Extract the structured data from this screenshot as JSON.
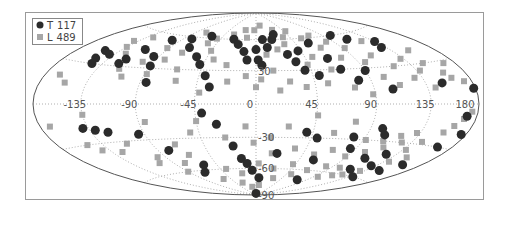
{
  "chart_data": {
    "type": "scatter",
    "projection": "aitoff-hammer (all-sky, galactic coordinates)",
    "title": "",
    "xlabel": "",
    "ylabel": "",
    "longitude_ticks": [
      "-135",
      "-90",
      "-45",
      "0",
      "45",
      "90",
      "135",
      "180"
    ],
    "latitude_ticks": [
      "30",
      "-30",
      "-60",
      "-90"
    ],
    "grid": true,
    "legend_position": "upper-left",
    "legend": [
      {
        "name": "T",
        "count": "117",
        "marker": "circle",
        "color": "#2b2b2b"
      },
      {
        "name": "L",
        "count": "489",
        "marker": "square",
        "color": "#a6a6a6"
      }
    ],
    "series": [
      {
        "name": "T",
        "count": 117,
        "note": "approximate (lon, lat) in degrees, representative subset read from image",
        "points": [
          [
            -150,
            40
          ],
          [
            -148,
            34
          ],
          [
            -145,
            30
          ],
          [
            -140,
            38
          ],
          [
            -120,
            32
          ],
          [
            -118,
            36
          ],
          [
            -112,
            45
          ],
          [
            -100,
            55
          ],
          [
            -95,
            40
          ],
          [
            -90,
            32
          ],
          [
            -85,
            18
          ],
          [
            -80,
            58
          ],
          [
            -70,
            50
          ],
          [
            -60,
            62
          ],
          [
            -55,
            42
          ],
          [
            -48,
            35
          ],
          [
            -40,
            25
          ],
          [
            -35,
            15
          ],
          [
            -28,
            60
          ],
          [
            -20,
            55
          ],
          [
            -12,
            48
          ],
          [
            -8,
            40
          ],
          [
            0,
            50
          ],
          [
            2,
            40
          ],
          [
            5,
            35
          ],
          [
            8,
            60
          ],
          [
            12,
            52
          ],
          [
            20,
            60
          ],
          [
            25,
            65
          ],
          [
            30,
            45
          ],
          [
            35,
            38
          ],
          [
            40,
            30
          ],
          [
            42,
            48
          ],
          [
            50,
            25
          ],
          [
            60,
            55
          ],
          [
            65,
            40
          ],
          [
            70,
            30
          ],
          [
            80,
            20
          ],
          [
            90,
            28
          ],
          [
            100,
            60
          ],
          [
            105,
            12
          ],
          [
            110,
            55
          ],
          [
            130,
            45
          ],
          [
            135,
            50
          ],
          [
            150,
            15
          ],
          [
            170,
            -8
          ],
          [
            178,
            10
          ],
          [
            -140,
            -18
          ],
          [
            -130,
            -20
          ],
          [
            -120,
            -22
          ],
          [
            -95,
            -25
          ],
          [
            -80,
            -40
          ],
          [
            -70,
            -62
          ],
          [
            -60,
            -55
          ],
          [
            -40,
            -8
          ],
          [
            -30,
            -18
          ],
          [
            -20,
            -38
          ],
          [
            -15,
            -50
          ],
          [
            -10,
            -55
          ],
          [
            -5,
            -62
          ],
          [
            0,
            -88
          ],
          [
            5,
            -70
          ],
          [
            20,
            -45
          ],
          [
            40,
            -25
          ],
          [
            50,
            -30
          ],
          [
            60,
            -50
          ],
          [
            75,
            -70
          ],
          [
            80,
            -28
          ],
          [
            85,
            -38
          ],
          [
            100,
            -20
          ],
          [
            105,
            -25
          ],
          [
            110,
            -45
          ],
          [
            115,
            -55
          ],
          [
            125,
            -40
          ],
          [
            130,
            -50
          ],
          [
            140,
            -60
          ],
          [
            150,
            -52
          ],
          [
            165,
            -30
          ],
          [
            160,
            -45
          ],
          [
            175,
            -20
          ]
        ]
      },
      {
        "name": "L",
        "count": 489,
        "note": "approximate (lon, lat) in degrees, representative subset read from image",
        "points": [
          [
            -165,
            20
          ],
          [
            -155,
            15
          ],
          [
            -140,
            50
          ],
          [
            -135,
            45
          ],
          [
            -128,
            55
          ],
          [
            -125,
            40
          ],
          [
            -115,
            28
          ],
          [
            -108,
            22
          ],
          [
            -100,
            35
          ],
          [
            -92,
            48
          ],
          [
            -88,
            25
          ],
          [
            -82,
            38
          ],
          [
            -75,
            65
          ],
          [
            -72,
            45
          ],
          [
            -65,
            30
          ],
          [
            -62,
            20
          ],
          [
            -55,
            55
          ],
          [
            -50,
            60
          ],
          [
            -45,
            48
          ],
          [
            -42,
            10
          ],
          [
            -38,
            40
          ],
          [
            -32,
            65
          ],
          [
            -25,
            35
          ],
          [
            -22,
            20
          ],
          [
            -18,
            70
          ],
          [
            -12,
            62
          ],
          [
            -8,
            25
          ],
          [
            -3,
            70
          ],
          [
            0,
            15
          ],
          [
            4,
            22
          ],
          [
            8,
            75
          ],
          [
            10,
            45
          ],
          [
            14,
            30
          ],
          [
            18,
            12
          ],
          [
            22,
            50
          ],
          [
            26,
            20
          ],
          [
            28,
            70
          ],
          [
            32,
            55
          ],
          [
            36,
            62
          ],
          [
            38,
            15
          ],
          [
            44,
            35
          ],
          [
            48,
            68
          ],
          [
            52,
            42
          ],
          [
            55,
            18
          ],
          [
            58,
            60
          ],
          [
            62,
            30
          ],
          [
            68,
            50
          ],
          [
            72,
            62
          ],
          [
            75,
            14
          ],
          [
            78,
            40
          ],
          [
            82,
            55
          ],
          [
            88,
            8
          ],
          [
            92,
            48
          ],
          [
            96,
            35
          ],
          [
            102,
            22
          ],
          [
            108,
            40
          ],
          [
            112,
            15
          ],
          [
            118,
            30
          ],
          [
            122,
            52
          ],
          [
            128,
            20
          ],
          [
            132,
            35
          ],
          [
            138,
            25
          ],
          [
            142,
            12
          ],
          [
            148,
            30
          ],
          [
            152,
            40
          ],
          [
            158,
            22
          ],
          [
            162,
            18
          ],
          [
            168,
            28
          ],
          [
            172,
            15
          ],
          [
            -170,
            -15
          ],
          [
            -150,
            -30
          ],
          [
            -142,
            -35
          ],
          [
            -135,
            -8
          ],
          [
            -125,
            -38
          ],
          [
            -112,
            -32
          ],
          [
            -105,
            -50
          ],
          [
            -98,
            -45
          ],
          [
            -90,
            -60
          ],
          [
            -85,
            -15
          ],
          [
            -78,
            -52
          ],
          [
            -70,
            -35
          ],
          [
            -65,
            -45
          ],
          [
            -58,
            -70
          ],
          [
            -52,
            -25
          ],
          [
            -45,
            -15
          ],
          [
            -38,
            -60
          ],
          [
            -30,
            -75
          ],
          [
            -25,
            -30
          ],
          [
            -20,
            -65
          ],
          [
            -12,
            -80
          ],
          [
            -8,
            -20
          ],
          [
            -2,
            -35
          ],
          [
            3,
            -55
          ],
          [
            8,
            -78
          ],
          [
            12,
            -30
          ],
          [
            15,
            -45
          ],
          [
            22,
            -60
          ],
          [
            25,
            -20
          ],
          [
            30,
            -70
          ],
          [
            35,
            -40
          ],
          [
            42,
            -55
          ],
          [
            46,
            -10
          ],
          [
            52,
            -65
          ],
          [
            56,
            -45
          ],
          [
            62,
            -25
          ],
          [
            66,
            -60
          ],
          [
            70,
            -40
          ],
          [
            76,
            -15
          ],
          [
            82,
            -55
          ],
          [
            88,
            -45
          ],
          [
            92,
            -30
          ],
          [
            96,
            -65
          ],
          [
            102,
            -40
          ],
          [
            108,
            -30
          ],
          [
            114,
            -35
          ],
          [
            120,
            -25
          ],
          [
            126,
            -30
          ],
          [
            132,
            -22
          ],
          [
            138,
            -35
          ],
          [
            144,
            -28
          ],
          [
            150,
            -40
          ],
          [
            156,
            -20
          ],
          [
            162,
            -15
          ],
          [
            168,
            -10
          ],
          [
            174,
            -5
          ],
          [
            120,
            -60
          ],
          [
            130,
            -55
          ],
          [
            140,
            -45
          ],
          [
            100,
            -55
          ],
          [
            110,
            -62
          ]
        ]
      }
    ]
  }
}
